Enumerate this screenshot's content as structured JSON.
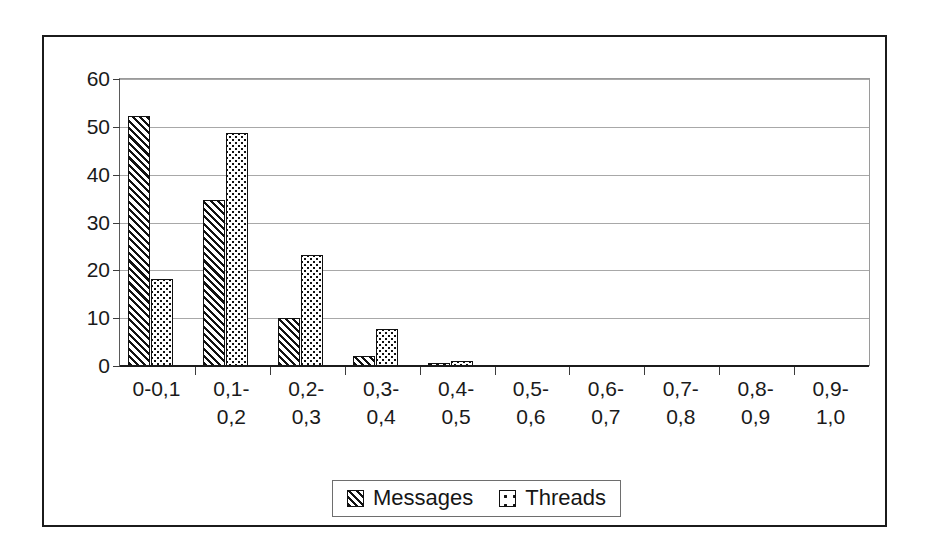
{
  "chart_data": {
    "type": "bar",
    "title": "",
    "subtitle": "",
    "xlabel": "",
    "ylabel": "",
    "ylim": [
      0,
      60
    ],
    "yticks": [
      0,
      10,
      20,
      30,
      40,
      50,
      60
    ],
    "ytick_labels": [
      "0",
      "10",
      "20",
      "30",
      "40",
      "50",
      "60"
    ],
    "grid": true,
    "legend_position": "bottom-center",
    "categories": [
      "0-0,1",
      "0,1-0,2",
      "0,2-0,3",
      "0,3-0,4",
      "0,4-0,5",
      "0,5-0,6",
      "0,6-0,7",
      "0,7-0,8",
      "0,8-0,9",
      "0,9-1,0"
    ],
    "category_lines": [
      [
        "0-0,1",
        ""
      ],
      [
        "0,1-",
        "0,2"
      ],
      [
        "0,2-",
        "0,3"
      ],
      [
        "0,3-",
        "0,4"
      ],
      [
        "0,4-",
        "0,5"
      ],
      [
        "0,5-",
        "0,6"
      ],
      [
        "0,6-",
        "0,7"
      ],
      [
        "0,7-",
        "0,8"
      ],
      [
        "0,8-",
        "0,9"
      ],
      [
        "0,9-",
        "1,0"
      ]
    ],
    "series": [
      {
        "name": "Messages",
        "pattern": "diagonal-hatch",
        "values": [
          52.3,
          34.7,
          10.0,
          2.0,
          0.4,
          0,
          0,
          0,
          0,
          0
        ]
      },
      {
        "name": "Threads",
        "pattern": "dotted",
        "values": [
          18.2,
          48.7,
          23.3,
          7.8,
          1.1,
          0,
          0,
          0,
          0,
          0
        ]
      }
    ]
  },
  "legend": {
    "items": [
      {
        "label": "Messages"
      },
      {
        "label": "Threads"
      }
    ]
  },
  "colors": {
    "ink": "#111111",
    "gridline": "#a8a8a8",
    "frame": "#1b1b1b",
    "background": "#ffffff"
  }
}
